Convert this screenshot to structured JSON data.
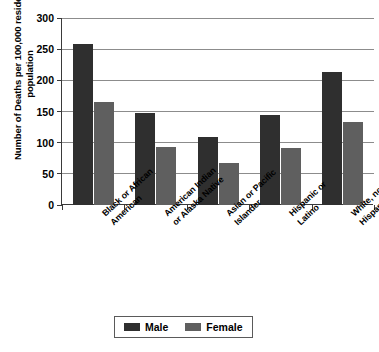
{
  "chart_data": {
    "type": "bar",
    "title": "",
    "xlabel": "",
    "ylabel": "Number of Deaths per 100,000 resident population",
    "ylim": [
      0,
      300
    ],
    "yticks": [
      0,
      50,
      100,
      150,
      200,
      250,
      300
    ],
    "ytick_labels": [
      "0",
      "50",
      "100",
      "150",
      "200",
      "250",
      "300"
    ],
    "grid": true,
    "legend_position": "bottom-center",
    "categories": [
      "Black or African American",
      "American Indian or Alaska Native",
      "Asian or Pacific Islander",
      "Hispanic or Latino",
      "White, not Hispanic or Latino"
    ],
    "category_lines": [
      [
        "Black or African",
        "American"
      ],
      [
        "American Indian",
        "or Alaska Native"
      ],
      [
        "Asian or Pacific",
        "Islander"
      ],
      [
        "Hispanic or",
        "Latino"
      ],
      [
        "White, not",
        "Hispanic or Latino"
      ]
    ],
    "series": [
      {
        "name": "Male",
        "color": "#2f2f2f",
        "values": [
          258,
          147,
          109,
          144,
          214
        ]
      },
      {
        "name": "Female",
        "color": "#5f5f5f",
        "values": [
          165,
          93,
          67,
          91,
          133
        ]
      }
    ]
  },
  "legend": {
    "entries": [
      {
        "label": "Male",
        "color": "#2f2f2f"
      },
      {
        "label": "Female",
        "color": "#5f5f5f"
      }
    ]
  }
}
